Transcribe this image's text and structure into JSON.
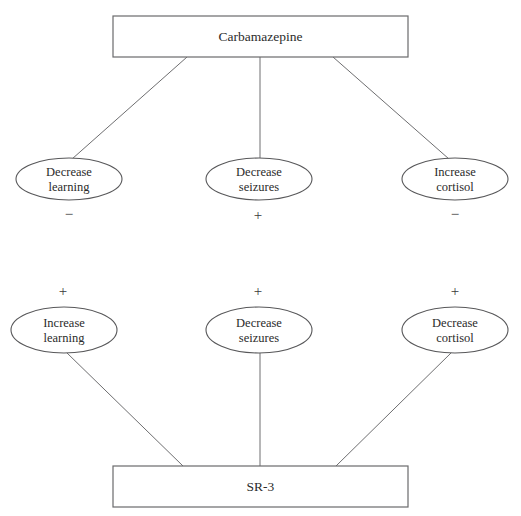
{
  "diagram": {
    "canvas": {
      "width": 521,
      "height": 516,
      "background": "#ffffff"
    },
    "colors": {
      "stroke": "#58585a",
      "edge": "#6e6e70",
      "text": "#2b2b2b",
      "background": "#ffffff"
    },
    "nodes": {
      "top_box": {
        "label": "Carbamazepine",
        "shape": "rectangle",
        "x": 113,
        "y": 16,
        "width": 295,
        "height": 41,
        "cx": 260.5,
        "cy": 36.5
      },
      "bottom_box": {
        "label": "SR-3",
        "shape": "rectangle",
        "x": 113,
        "y": 466,
        "width": 295,
        "height": 41,
        "cx": 260.5,
        "cy": 486.5
      },
      "top_ellipses": [
        {
          "line1": "Decrease",
          "line2": "learning",
          "shape": "ellipse",
          "cx": 69,
          "cy": 179,
          "rx": 53,
          "ry": 21
        },
        {
          "line1": "Decrease",
          "line2": "seizures",
          "shape": "ellipse",
          "cx": 259,
          "cy": 179,
          "rx": 53,
          "ry": 21
        },
        {
          "line1": "Increase",
          "line2": "cortisol",
          "shape": "ellipse",
          "cx": 455,
          "cy": 179,
          "rx": 53,
          "ry": 21
        }
      ],
      "bottom_ellipses": [
        {
          "line1": "Increase",
          "line2": "learning",
          "shape": "ellipse",
          "cx": 64,
          "cy": 330,
          "rx": 53,
          "ry": 23
        },
        {
          "line1": "Decrease",
          "line2": "seizures",
          "shape": "ellipse",
          "cx": 259,
          "cy": 330,
          "rx": 53,
          "ry": 23
        },
        {
          "line1": "Decrease",
          "line2": "cortisol",
          "shape": "ellipse",
          "cx": 455,
          "cy": 330,
          "rx": 53,
          "ry": 23
        }
      ]
    },
    "signs": {
      "top_row": [
        {
          "symbol": "−",
          "x": 69,
          "y": 216,
          "meaning": "negative-effect-decrease-learning"
        },
        {
          "symbol": "+",
          "x": 258,
          "y": 217,
          "meaning": "positive-effect-decrease-seizures"
        },
        {
          "symbol": "−",
          "x": 455,
          "y": 216,
          "meaning": "negative-effect-increase-cortisol"
        }
      ],
      "bottom_row": [
        {
          "symbol": "+",
          "x": 63,
          "y": 293,
          "meaning": "positive-effect-increase-learning"
        },
        {
          "symbol": "+",
          "x": 258,
          "y": 293,
          "meaning": "positive-effect-decrease-seizures"
        },
        {
          "symbol": "+",
          "x": 455,
          "y": 293,
          "meaning": "positive-effect-decrease-cortisol"
        }
      ]
    },
    "edges": [
      {
        "name": "carbamazepine-to-decrease-learning",
        "x1": 187,
        "y1": 57,
        "x2": 72,
        "y2": 159
      },
      {
        "name": "carbamazepine-to-decrease-seizures",
        "x1": 260,
        "y1": 57,
        "x2": 260,
        "y2": 158
      },
      {
        "name": "carbamazepine-to-increase-cortisol",
        "x1": 333,
        "y1": 57,
        "x2": 449,
        "y2": 159
      },
      {
        "name": "increase-learning-to-sr3",
        "x1": 66,
        "y1": 352,
        "x2": 183,
        "y2": 466
      },
      {
        "name": "decrease-seizures-to-sr3",
        "x1": 260,
        "y1": 353,
        "x2": 260,
        "y2": 466
      },
      {
        "name": "decrease-cortisol-to-sr3",
        "x1": 452,
        "y1": 352,
        "x2": 336,
        "y2": 466
      }
    ]
  }
}
